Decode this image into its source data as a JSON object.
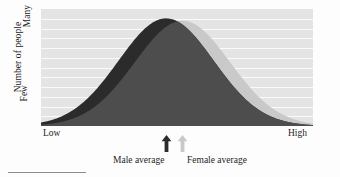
{
  "chart_data": {
    "type": "area",
    "title": "",
    "subtitle": "",
    "xlabel": "",
    "ylabel": "Number of people",
    "x_tick_labels": [
      "Low",
      "High"
    ],
    "y_tick_labels": [
      "Few",
      "Many"
    ],
    "xlim": [
      "Low",
      "High"
    ],
    "ylim": [
      "Few",
      "Many"
    ],
    "grid": true,
    "grid_orientation": "horizontal",
    "gridline_count": 11,
    "legend_position": "below-axis",
    "plot_background": "#e4e4e4",
    "gridline_color": "#fafafa",
    "series": [
      {
        "name": "Male average",
        "label": "Male average",
        "color": "#2b2b2b",
        "distribution": "normal",
        "mean_x_fraction": 0.46,
        "peak_y_fraction": 0.92,
        "std_x_fraction": 0.175,
        "marker": "arrow-up",
        "marker_x_fraction": 0.46
      },
      {
        "name": "Female average",
        "label": "Female average",
        "color": "#c9c9c9",
        "distribution": "normal",
        "mean_x_fraction": 0.52,
        "peak_y_fraction": 0.9,
        "std_x_fraction": 0.175,
        "marker": "arrow-up",
        "marker_x_fraction": 0.52
      }
    ],
    "overlap_color": "#4d4d4d",
    "annotations": [
      {
        "text": "Male average",
        "kind": "series-caption"
      },
      {
        "text": "Female average",
        "kind": "series-caption"
      }
    ]
  },
  "axes": {
    "y_title": "Number of people",
    "y_top_label": "Many",
    "y_bottom_label": "Few",
    "x_left_label": "Low",
    "x_right_label": "High"
  },
  "legend": {
    "male_label": "Male average",
    "female_label": "Female average"
  },
  "colors": {
    "male": "#2b2b2b",
    "female": "#c9c9c9",
    "overlap": "#4d4d4d",
    "plot_bg": "#e4e4e4",
    "gridline": "#fafafa",
    "text": "#1d1d1d"
  }
}
